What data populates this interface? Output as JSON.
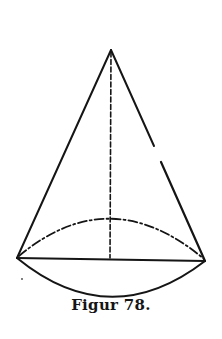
{
  "figure": {
    "caption": "Figur 78.",
    "line_color": "#151515",
    "background": "#ffffff",
    "apex": [
      111,
      50
    ],
    "base_left": [
      17,
      258
    ],
    "base_right": [
      205,
      261
    ],
    "base_center": [
      110,
      259
    ],
    "back_arc_peak_y": 218,
    "front_arc_bottom_y": 296,
    "right_edge_gap": [
      [
        154,
        147
      ],
      [
        160,
        162
      ]
    ]
  }
}
